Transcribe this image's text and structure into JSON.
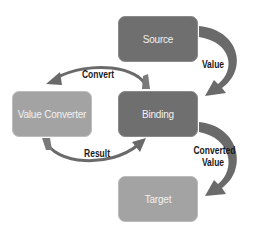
{
  "diagram": {
    "nodes": {
      "source": "Source",
      "binding": "Binding",
      "value_converter": "Value Converter",
      "target": "Target"
    },
    "edges": {
      "source_to_binding": "Value",
      "binding_to_converter": "Convert",
      "converter_to_binding": "Result",
      "binding_to_target_line1": "Converted",
      "binding_to_target_line2": "Value"
    },
    "colors": {
      "dark_node": "#6f6f6f",
      "light_node": "#a3a3a3",
      "arrow": "#6a6a6a"
    }
  }
}
